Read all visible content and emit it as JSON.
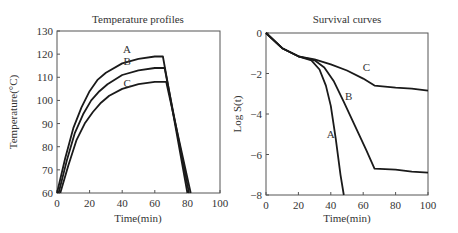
{
  "chart_data": [
    {
      "type": "line",
      "title": "Temperature profiles",
      "xlabel": "Time(min)",
      "ylabel": "Temperature(°C)",
      "xlim": [
        0,
        100
      ],
      "ylim": [
        60,
        130
      ],
      "xticks": [
        "0",
        "20",
        "40",
        "60",
        "80",
        "100"
      ],
      "yticks": [
        "60",
        "70",
        "80",
        "90",
        "100",
        "110",
        "120",
        "130"
      ],
      "grid": false,
      "legend": "inline labels",
      "series": [
        {
          "name": "A",
          "x": [
            0,
            5,
            10,
            15,
            20,
            25,
            30,
            40,
            50,
            60,
            65,
            80
          ],
          "y": [
            60,
            75,
            88,
            97,
            104,
            109,
            112,
            116,
            118,
            119,
            119,
            60
          ]
        },
        {
          "name": "B",
          "x": [
            1,
            6,
            11,
            16,
            21,
            26,
            31,
            40,
            50,
            60,
            66,
            81
          ],
          "y": [
            60,
            74,
            86,
            94,
            100,
            104,
            107,
            111,
            113,
            114,
            114,
            60
          ]
        },
        {
          "name": "C",
          "x": [
            2,
            7,
            12,
            17,
            22,
            27,
            32,
            40,
            50,
            60,
            67,
            82
          ],
          "y": [
            60,
            72,
            83,
            90,
            95,
            99,
            102,
            105,
            107,
            108,
            108,
            60
          ]
        }
      ]
    },
    {
      "type": "line",
      "title": "Survival curves",
      "xlabel": "Time(min)",
      "ylabel": "Log S(t)",
      "xlim": [
        0,
        100
      ],
      "ylim": [
        -8,
        0
      ],
      "xticks": [
        "0",
        "20",
        "40",
        "60",
        "80",
        "100"
      ],
      "yticks": [
        "0",
        "-2",
        "-4",
        "-6",
        "-8"
      ],
      "grid": false,
      "legend": "inline labels",
      "series": [
        {
          "name": "A",
          "x": [
            0,
            10,
            20,
            28,
            33,
            37,
            40,
            43,
            46,
            48
          ],
          "y": [
            0,
            -0.75,
            -1.15,
            -1.35,
            -1.8,
            -2.6,
            -3.6,
            -5.2,
            -7.0,
            -8.0
          ]
        },
        {
          "name": "B",
          "x": [
            0,
            10,
            20,
            30,
            36,
            42,
            48,
            55,
            62,
            67,
            80,
            90,
            100
          ],
          "y": [
            0,
            -0.75,
            -1.15,
            -1.35,
            -1.7,
            -2.4,
            -3.4,
            -4.6,
            -5.8,
            -6.7,
            -6.75,
            -6.85,
            -6.9
          ]
        },
        {
          "name": "C",
          "x": [
            0,
            10,
            20,
            30,
            40,
            50,
            60,
            67,
            80,
            90,
            100
          ],
          "y": [
            0,
            -0.75,
            -1.15,
            -1.3,
            -1.55,
            -1.85,
            -2.25,
            -2.6,
            -2.7,
            -2.75,
            -2.85
          ]
        }
      ]
    }
  ]
}
